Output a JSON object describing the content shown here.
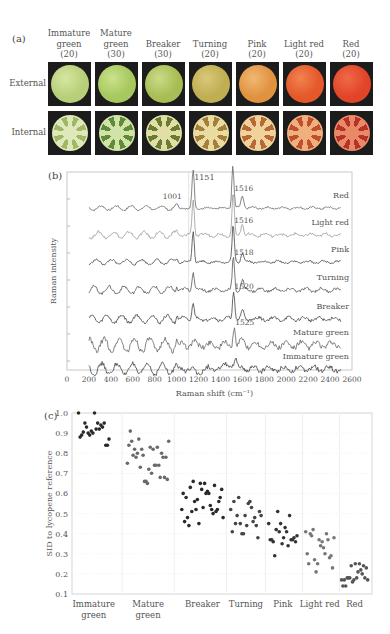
{
  "figure": {
    "panel_a": {
      "label": "(a)",
      "row_labels": [
        "External",
        "Internal"
      ],
      "stages": [
        {
          "name_line1": "Immature",
          "name_line2": "green",
          "count": "(20)",
          "ext": "#b8cf7a",
          "ext_hi": "#d7e6a0",
          "int_flesh": "#dfe8b9",
          "int_loc": "#9eb865"
        },
        {
          "name_line1": "Mature",
          "name_line2": "green",
          "count": "(30)",
          "ext": "#a6c85e",
          "ext_hi": "#cbe28c",
          "int_flesh": "#d2e3a8",
          "int_loc": "#5f8b3a"
        },
        {
          "name_line1": "",
          "name_line2": "Breaker",
          "count": "(30)",
          "ext": "#a8bd55",
          "ext_hi": "#cadb86",
          "int_flesh": "#e2dfa6",
          "int_loc": "#6a7b32"
        },
        {
          "name_line1": "",
          "name_line2": "Turning",
          "count": "(20)",
          "ext": "#bfae52",
          "ext_hi": "#d9c878",
          "int_flesh": "#eadba0",
          "int_loc": "#a47e3c"
        },
        {
          "name_line1": "",
          "name_line2": "Pink",
          "count": "(20)",
          "ext": "#e0923f",
          "ext_hi": "#f0b872",
          "int_flesh": "#f0d29c",
          "int_loc": "#b86a34"
        },
        {
          "name_line1": "",
          "name_line2": "Light red",
          "count": "(20)",
          "ext": "#e4582a",
          "ext_hi": "#f18350",
          "int_flesh": "#f0b07e",
          "int_loc": "#c0502d"
        },
        {
          "name_line1": "",
          "name_line2": "Red",
          "count": "(20)",
          "ext": "#e2442a",
          "ext_hi": "#ee6a46",
          "int_flesh": "#e98a66",
          "int_loc": "#b7322a"
        }
      ]
    },
    "panel_b": {
      "label": "(b)"
    },
    "panel_c": {
      "label": "(c)"
    }
  },
  "chart_data": [
    {
      "type": "line",
      "title": "",
      "panel": "(b)",
      "xlabel": "Raman shift (cm⁻¹)",
      "ylabel": "Raman intensity",
      "xlim": [
        0,
        2600
      ],
      "xticks": [
        0,
        200,
        400,
        600,
        800,
        1000,
        1200,
        1400,
        1600,
        1800,
        2000,
        2200,
        2400,
        2600
      ],
      "grid": "vertical reference line at ~1100",
      "series": [
        {
          "name": "Red",
          "main_peak": 1513,
          "other_peaks": [
            1001,
            1151
          ],
          "color": "#666666"
        },
        {
          "name": "Light red",
          "main_peak": 1516,
          "other_peaks": [
            1151
          ],
          "color": "#999999"
        },
        {
          "name": "Pink",
          "main_peak": 1516,
          "other_peaks": [
            1151
          ],
          "color": "#444444"
        },
        {
          "name": "Turning",
          "main_peak": 1518,
          "other_peaks": [
            1151
          ],
          "color": "#555555"
        },
        {
          "name": "Breaker",
          "main_peak": 1520,
          "other_peaks": [
            1151
          ],
          "color": "#444444"
        },
        {
          "name": "Mature green",
          "main_peak": 1525,
          "other_peaks": [],
          "color": "#666666"
        },
        {
          "name": "Immature green",
          "main_peak": null,
          "other_peaks": [],
          "color": "#444444"
        }
      ],
      "annotations": [
        "1001",
        "1151",
        "1513",
        "1516",
        "1516",
        "1518",
        "1520",
        "1525"
      ]
    },
    {
      "type": "scatter",
      "title": "",
      "panel": "(c)",
      "xlabel": "",
      "ylabel": "SID to lycopene reference",
      "ylim": [
        0.1,
        1.0
      ],
      "yticks": [
        "1.0",
        "0.9",
        "0.8",
        "0.7",
        "0.6",
        "0.5",
        "0.4",
        "0.3",
        "0.2",
        "0.1"
      ],
      "categories": [
        "Immature\ngreen",
        "Mature\ngreen",
        "Breaker",
        "Turning",
        "Pink",
        "Light red",
        "Red"
      ],
      "grid": true,
      "series": [
        {
          "name": "Immature green",
          "color": "#2a2a2a",
          "values": [
            1.0,
            0.88,
            0.89,
            0.905,
            0.95,
            0.93,
            0.9,
            0.89,
            0.91,
            0.9,
            1.0,
            0.92,
            0.95,
            0.92,
            0.94,
            0.93,
            0.95,
            0.84,
            0.84,
            0.87
          ]
        },
        {
          "name": "Mature green",
          "color": "#6a6a6a",
          "values": [
            0.75,
            0.84,
            0.91,
            0.86,
            0.79,
            0.82,
            0.78,
            0.8,
            0.87,
            0.73,
            0.82,
            0.79,
            0.66,
            0.66,
            0.65,
            0.72,
            0.83,
            0.7,
            0.82,
            0.74,
            0.74,
            0.83,
            0.74,
            0.68,
            0.8,
            0.78,
            0.68,
            0.78,
            0.67,
            0.86
          ]
        },
        {
          "name": "Breaker",
          "color": "#2a2a2a",
          "values": [
            0.52,
            0.6,
            0.46,
            0.58,
            0.48,
            0.44,
            0.63,
            0.51,
            0.66,
            0.56,
            0.52,
            0.57,
            0.45,
            0.65,
            0.62,
            0.53,
            0.65,
            0.6,
            0.61,
            0.6,
            0.54,
            0.52,
            0.5,
            0.64,
            0.51,
            0.52,
            0.56,
            0.58,
            0.62,
            0.48
          ]
        },
        {
          "name": "Turning",
          "color": "#444444",
          "values": [
            0.52,
            0.41,
            0.56,
            0.45,
            0.49,
            0.58,
            0.45,
            0.4,
            0.4,
            0.49,
            0.44,
            0.55,
            0.56,
            0.53,
            0.46,
            0.48,
            0.44,
            0.38,
            0.51,
            0.49
          ]
        },
        {
          "name": "Pink",
          "color": "#333333",
          "values": [
            0.45,
            0.37,
            0.37,
            0.36,
            0.29,
            0.42,
            0.51,
            0.41,
            0.45,
            0.35,
            0.38,
            0.43,
            0.41,
            0.34,
            0.49,
            0.37,
            0.37,
            0.38,
            0.36,
            0.39
          ]
        },
        {
          "name": "Light red",
          "color": "#777777",
          "values": [
            0.41,
            0.3,
            0.25,
            0.4,
            0.39,
            0.42,
            0.27,
            0.21,
            0.25,
            0.37,
            0.34,
            0.36,
            0.33,
            0.3,
            0.4,
            0.37,
            0.28,
            0.29,
            0.23,
            0.38
          ]
        },
        {
          "name": "Red",
          "color": "#555555",
          "values": [
            0.17,
            0.14,
            0.17,
            0.14,
            0.18,
            0.18,
            0.18,
            0.24,
            0.16,
            0.17,
            0.25,
            0.18,
            0.21,
            0.25,
            0.22,
            0.2,
            0.24,
            0.18,
            0.23,
            0.17
          ]
        }
      ]
    }
  ]
}
